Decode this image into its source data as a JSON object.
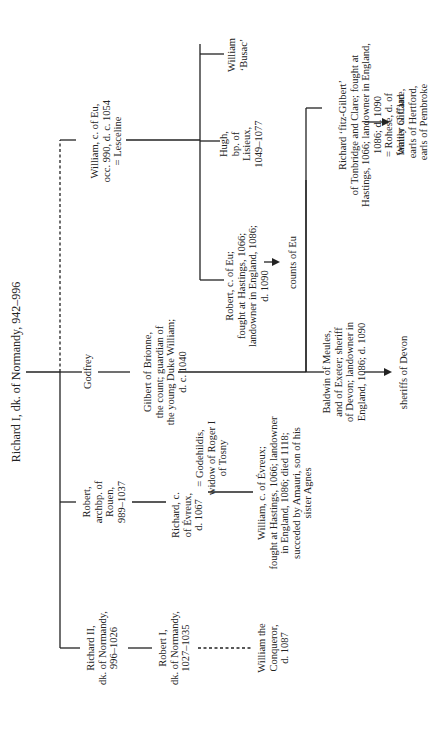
{
  "diagram": {
    "orientation": "rotated-90-ccw",
    "root": {
      "name": "Richard I, dk. of Normandy, 942–996"
    },
    "people": {
      "richard_ii": "Richard II,\ndk. of Normandy,\n996–1026",
      "robert_archbp": "Robert,\narchbp. of\nRouen,\n989–1037",
      "godfrey": "Godfrey",
      "william_eu": "William, c. of Eu,\nocc. 990, d. c. 1054\n= Lesceline",
      "robert_i": "Robert I,\ndk. of Normandy,\n1027–1035",
      "william_conqueror": "William the\nConqueror,\nd. 1087",
      "richard_evreux": "Richard, c.\nof Évreux,\nd. 1067",
      "godehildis": "= Godehildis,\nwidow of Roger I\nof Tosny",
      "william_evreux": "William, c. of Évreux;\nfought at Hastings, 1066; landowner\nin England, 1086; died 1118;\nsucceded by Amauri, son of his\nsister Agnes",
      "gilbert_brionne": "Gilbert of Brionne,\nthe count; guardian of\nthe young Duke William;\nd. c. 1040",
      "baldwin_meules": "Baldwin of Meules,\nand of Exeter; sheriff\nof Devon; landowner in\nEngland, 1086; d. 1090",
      "sheriffs_devon": "sheriffs of Devon",
      "richard_fitz_gilbert": "Richard ‘fitz-Gilbert’\nof Tonbridge and Clare; fought at\nHastings, 1066; landowner in England,\n1086; d. 1090\n= Rohese, d. of\nWalter Giffard",
      "family_clare": "family of Clare,\nearls of Hertford,\nearls of Pembroke",
      "robert_eu": "Robert, c. of Eu;\nfought at Hastings, 1066;\nlandowner in England, 1086;\nd. 1090",
      "counts_eu": "counts of Eu",
      "hugh_lisieux": "Hugh,\nbp. of\nLisieux,\n1049–1077",
      "william_busac": "William\n‘Busac’"
    },
    "relations": [
      {
        "from": "Richard I",
        "to": "Richard II",
        "type": "child"
      },
      {
        "from": "Richard I",
        "to": "Robert, archbp. of Rouen",
        "type": "child"
      },
      {
        "from": "Richard I",
        "to": "Godfrey",
        "type": "child"
      },
      {
        "from": "Richard I",
        "to": "William, c. of Eu",
        "type": "illegitimate-child (dashed)"
      },
      {
        "from": "Richard II",
        "to": "Robert I",
        "type": "child"
      },
      {
        "from": "Robert I",
        "to": "William the Conqueror",
        "type": "illegitimate-child (dashed)"
      },
      {
        "from": "Robert, archbp.",
        "to": "Richard, c. of Évreux",
        "type": "child"
      },
      {
        "from": "Richard, c. of Évreux",
        "to": "William, c. of Évreux",
        "type": "child"
      },
      {
        "from": "Godfrey",
        "to": "Gilbert of Brionne",
        "type": "child"
      },
      {
        "from": "Gilbert of Brionne",
        "to": "Baldwin of Meules",
        "type": "child"
      },
      {
        "from": "Gilbert of Brionne",
        "to": "Richard fitz-Gilbert",
        "type": "child"
      },
      {
        "from": "Baldwin of Meules",
        "to": "sheriffs of Devon",
        "type": "descendants"
      },
      {
        "from": "Richard fitz-Gilbert",
        "to": "family of Clare",
        "type": "descendants"
      },
      {
        "from": "William, c. of Eu",
        "to": "Robert, c. of Eu",
        "type": "child"
      },
      {
        "from": "William, c. of Eu",
        "to": "Hugh, bp. of Lisieux",
        "type": "child"
      },
      {
        "from": "William, c. of Eu",
        "to": "William Busac",
        "type": "child"
      },
      {
        "from": "Robert, c. of Eu",
        "to": "counts of Eu",
        "type": "descendants"
      }
    ]
  }
}
